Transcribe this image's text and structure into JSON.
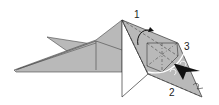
{
  "diagram": {
    "type": "origami-fold-step",
    "labels": [
      {
        "id": "1",
        "text": "1"
      },
      {
        "id": "2",
        "text": "2"
      },
      {
        "id": "3",
        "text": "3"
      }
    ],
    "colors": {
      "paper_fill": "#b9b9b9",
      "paper_white": "#ffffff",
      "line": "#333333",
      "arrow_dark": "#111111",
      "arrow_white": "#ffffff"
    }
  }
}
